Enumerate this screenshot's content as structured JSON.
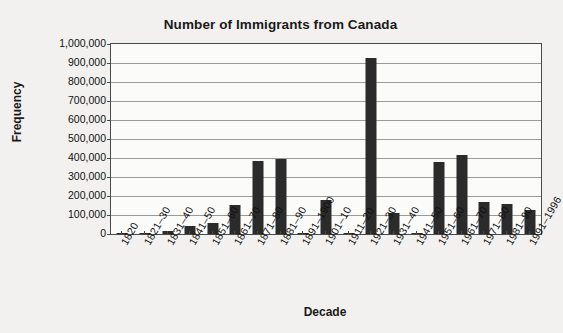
{
  "chart_data": {
    "type": "bar",
    "title": "Number of Immigrants from Canada",
    "xlabel": "Decade",
    "ylabel": "Frequency",
    "ylim": [
      0,
      1000000
    ],
    "ytick_step": 100000,
    "grid": true,
    "legend": "none",
    "bar_color": "#2b2b2b",
    "plot_background": "#fbfbfa",
    "page_background": "#f2f1ef",
    "axis_color": "#4a4a4a",
    "gridline_color": "#9a9a9a",
    "ytick_labels": [
      "1,000,000",
      "900,000",
      "800,000",
      "700,000",
      "600,000",
      "500,000",
      "400,000",
      "300,000",
      "200,000",
      "100,000",
      "0"
    ],
    "ytick_values": [
      1000000,
      900000,
      800000,
      700000,
      600000,
      500000,
      400000,
      300000,
      200000,
      100000,
      0
    ],
    "categories": [
      "1820",
      "1821–30",
      "1831–40",
      "1841–50",
      "1851–60",
      "1861–70",
      "1871–80",
      "1881–90",
      "1891–1900",
      "1901–10",
      "1911–20",
      "1921–30",
      "1931–40",
      "1941–50",
      "1951–60",
      "1961–70",
      "1971–80",
      "1981–90",
      "1991–1996"
    ],
    "values": [
      209,
      2277,
      13624,
      41723,
      59309,
      153878,
      383640,
      393304,
      3311,
      179226,
      742,
      924515,
      108527,
      1203,
      377952,
      413310,
      169939,
      156938,
      127144
    ]
  }
}
